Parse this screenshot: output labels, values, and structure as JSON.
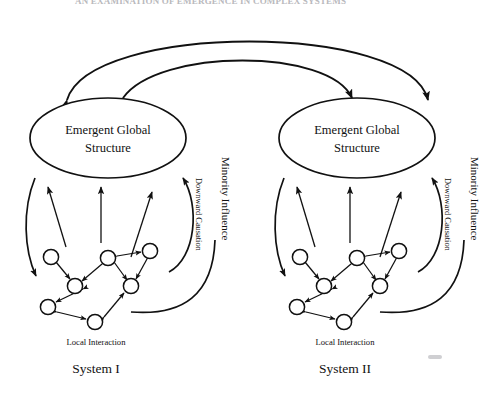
{
  "page": {
    "header_text": "AN EXAMINATION OF EMERGENCE IN COMPLEX SYSTEMS",
    "background_color": "#ffffff",
    "ink_color": "#111111",
    "width": 499,
    "height": 396
  },
  "diagram": {
    "type": "emergence-downward-causation-two-systems",
    "title": "",
    "cross_system_arcs": [
      {
        "name": "outer-arc",
        "from": "System II region",
        "to": "System I region",
        "arrowheads": [
          "left-end-down",
          "right-end-down"
        ]
      },
      {
        "name": "inner-arc",
        "from": "System I region",
        "to": "System II region",
        "arrowheads": [
          "left-end-down",
          "right-end-down"
        ]
      }
    ],
    "systems": [
      {
        "id": "system-1",
        "label": "System I",
        "ellipse_label_line1": "Emergent Global",
        "ellipse_label_line2": "Structure",
        "network_label": "Local Interaction",
        "downward_label": "Downward Causation",
        "minority_label": "Minority Influence",
        "upward_arrow_count": 3,
        "node_count": 7
      },
      {
        "id": "system-2",
        "label": "System II",
        "ellipse_label_line1": "Emergent Global",
        "ellipse_label_line2": "Structure",
        "network_label": "Local Interaction",
        "downward_label": "Downward Causation",
        "minority_label": "Minority Influence",
        "upward_arrow_count": 3,
        "node_count": 7
      }
    ]
  }
}
